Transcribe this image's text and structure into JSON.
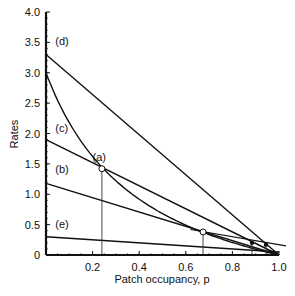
{
  "chart_data": {
    "type": "line",
    "title": "",
    "xlabel": "Patch occupancy, p",
    "ylabel": "Rates",
    "xlim": [
      0,
      1.0
    ],
    "ylim": [
      0,
      4.0
    ],
    "xticks": [
      "0.2",
      "0.4",
      "0.6",
      "0.8",
      "1.0"
    ],
    "yticks": [
      "0",
      "0.5",
      "1.0",
      "1.5",
      "2.0",
      "2.5",
      "3.0",
      "3.5",
      "4.0"
    ],
    "grid": false,
    "series": [
      {
        "name": "(a)",
        "kind": "curve",
        "x": [
          0,
          0.24,
          0.674,
          1.0
        ],
        "values": [
          3.0,
          1.42,
          0.38,
          0
        ]
      },
      {
        "name": "(b)",
        "kind": "line",
        "x": [
          0,
          1.0
        ],
        "values": [
          1.18,
          0
        ]
      },
      {
        "name": "(c)",
        "kind": "line",
        "x": [
          0,
          1.0
        ],
        "values": [
          1.9,
          0
        ]
      },
      {
        "name": "(d)",
        "kind": "line",
        "x": [
          0,
          1.0
        ],
        "values": [
          3.3,
          0
        ]
      },
      {
        "name": "(e)",
        "kind": "line",
        "x": [
          0,
          1.0
        ],
        "values": [
          0.3,
          0.05
        ]
      }
    ],
    "annotations": [
      {
        "type": "open-circle",
        "x": 0.24,
        "y": 1.42,
        "label": "intersection of (a) and (c)"
      },
      {
        "type": "open-circle",
        "x": 0.674,
        "y": 0.38,
        "label": "intersection of (a) and (b)"
      },
      {
        "type": "filled-dot",
        "x": 0.884,
        "y": 0.2
      },
      {
        "type": "filled-dot",
        "x": 0.944,
        "y": 0.17
      }
    ]
  }
}
